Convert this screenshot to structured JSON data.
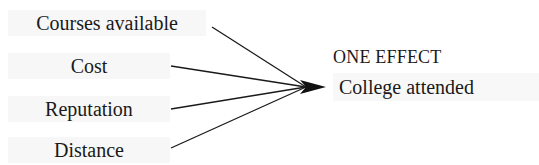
{
  "diagram": {
    "causes": [
      {
        "label": "Courses available"
      },
      {
        "label": "Cost"
      },
      {
        "label": "Reputation"
      },
      {
        "label": "Distance"
      }
    ],
    "effect": {
      "heading": "ONE EFFECT",
      "label": "College attended"
    },
    "colors": {
      "line": "#1a1a1a",
      "box": "#f7f7f7"
    }
  }
}
